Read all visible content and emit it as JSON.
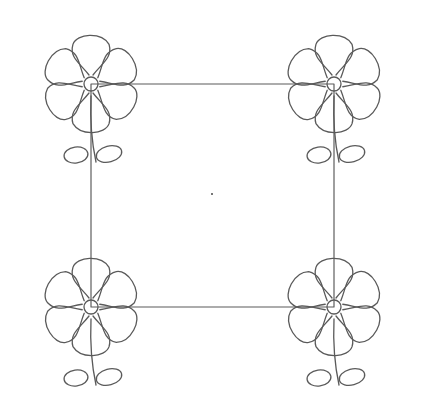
{
  "diagram": {
    "background": "#ffffff",
    "line_color": "#5a5a5a",
    "stroke_width": 1.3,
    "square": {
      "corners": [
        [
          91,
          84
        ],
        [
          334,
          84
        ],
        [
          334,
          307
        ],
        [
          91,
          307
        ]
      ]
    },
    "center_dot": {
      "x": 212,
      "y": 194,
      "size": 2
    },
    "flowers": [
      {
        "id": "top-left",
        "cx": 91,
        "cy": 84
      },
      {
        "id": "top-right",
        "cx": 334,
        "cy": 84
      },
      {
        "id": "bottom-left",
        "cx": 91,
        "cy": 307
      },
      {
        "id": "bottom-right",
        "cx": 334,
        "cy": 307
      }
    ],
    "flower_shape": {
      "petal_count": 6,
      "petal_angles": [
        -60,
        0,
        60,
        120,
        180,
        240
      ],
      "center_circle_radius": 7,
      "petal_length": 62,
      "petal_width": 40,
      "leaf_count": 2
    }
  }
}
